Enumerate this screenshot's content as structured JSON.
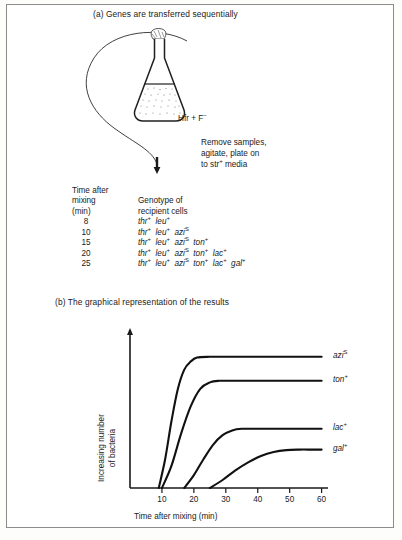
{
  "panel_a": {
    "heading": "(a) Genes are transferred sequentially",
    "flask_label_prefix": "Hfr + F",
    "flask_label_sup": "−",
    "note_lines": [
      "Remove samples,",
      "agitate, plate on",
      "to str"
    ],
    "note_sup": "+",
    "note_tail": " media"
  },
  "table": {
    "header_time": [
      "Time after",
      "mixing",
      "(min)"
    ],
    "header_genotype": [
      "Genotype of",
      "recipient cells"
    ],
    "rows": [
      {
        "time": "8",
        "genes": [
          {
            "name": "thr",
            "sup": "+"
          },
          {
            "name": "leu",
            "sup": "+"
          }
        ]
      },
      {
        "time": "10",
        "genes": [
          {
            "name": "thr",
            "sup": "+"
          },
          {
            "name": "leu",
            "sup": "+"
          },
          {
            "name": "azi",
            "sup": "S"
          }
        ]
      },
      {
        "time": "15",
        "genes": [
          {
            "name": "thr",
            "sup": "+"
          },
          {
            "name": "leu",
            "sup": "+"
          },
          {
            "name": "azi",
            "sup": "S"
          },
          {
            "name": "ton",
            "sup": "+"
          }
        ]
      },
      {
        "time": "20",
        "genes": [
          {
            "name": "thr",
            "sup": "+"
          },
          {
            "name": "leu",
            "sup": "+"
          },
          {
            "name": "azi",
            "sup": "S"
          },
          {
            "name": "ton",
            "sup": "+"
          },
          {
            "name": "lac",
            "sup": "+"
          }
        ]
      },
      {
        "time": "25",
        "genes": [
          {
            "name": "thr",
            "sup": "+"
          },
          {
            "name": "leu",
            "sup": "+"
          },
          {
            "name": "azi",
            "sup": "S"
          },
          {
            "name": "ton",
            "sup": "+"
          },
          {
            "name": "lac",
            "sup": "+"
          },
          {
            "name": "gal",
            "sup": "+"
          }
        ]
      }
    ]
  },
  "panel_b": {
    "heading": "(b) The graphical representation of the results"
  },
  "chart_data": {
    "type": "line",
    "title": "(b) The graphical representation of the results",
    "xlabel": "Time after mixing (min)",
    "ylabel": "Increasing number of bacteria",
    "ylabel_lines": [
      "Increasing number",
      "of bacteria"
    ],
    "xlim": [
      0,
      62
    ],
    "ylim": [
      0,
      100
    ],
    "xticks": [
      10,
      20,
      30,
      40,
      50,
      60
    ],
    "xtick_labels": [
      "10",
      "20",
      "30",
      "40",
      "50",
      "60"
    ],
    "yticks": [],
    "grid": false,
    "legend_position": "right-inline",
    "series": [
      {
        "name": "azi",
        "sup": "S",
        "label": "aziS",
        "onset_min": 9,
        "plateau": 82,
        "x": [
          9,
          11,
          13,
          15,
          17,
          19,
          21,
          25,
          30,
          40,
          50,
          60
        ],
        "y": [
          0,
          18,
          42,
          62,
          74,
          79,
          81.5,
          82,
          82,
          82,
          82,
          82
        ]
      },
      {
        "name": "ton",
        "sup": "+",
        "label": "ton+",
        "onset_min": 10,
        "plateau": 67,
        "x": [
          10,
          13,
          16,
          19,
          22,
          25,
          28,
          32,
          40,
          50,
          60
        ],
        "y": [
          0,
          14,
          34,
          51,
          62,
          66,
          67,
          67,
          67,
          67,
          67
        ]
      },
      {
        "name": "lac",
        "sup": "+",
        "label": "lac+",
        "onset_min": 17,
        "plateau": 37,
        "x": [
          17,
          20,
          23,
          26,
          29,
          32,
          35,
          40,
          50,
          60
        ],
        "y": [
          0,
          8,
          18,
          27,
          33,
          36,
          37,
          37,
          37,
          37
        ]
      },
      {
        "name": "gal",
        "sup": "+",
        "label": "gal+",
        "onset_min": 25,
        "plateau": 24,
        "x": [
          25,
          29,
          33,
          37,
          41,
          45,
          49,
          53,
          57,
          60
        ],
        "y": [
          0,
          5,
          11,
          16,
          20,
          22.5,
          23.7,
          24,
          24,
          24
        ]
      }
    ]
  }
}
